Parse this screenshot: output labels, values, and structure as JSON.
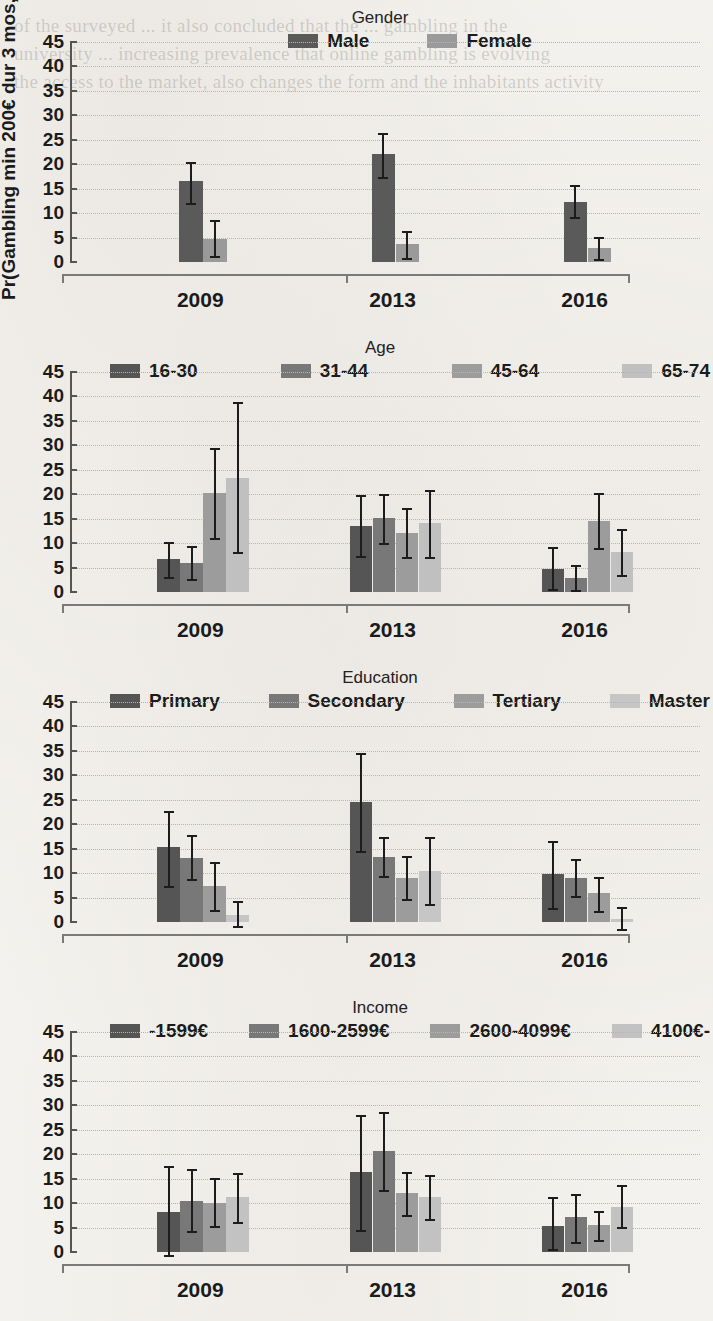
{
  "figure": {
    "ylabel": "Pr(Gambling min 200€ dur 3 mos, %)",
    "ghost_text": "of the surveyed ... it also concluded that the ... gambling in the\nuniversity ... increasing prevalence that online gambling is evolving\nthe access to the market, also changes the form and the inhabitants activity"
  },
  "chart_data": [
    {
      "type": "bar",
      "title": "Gender",
      "xlabel": "",
      "ylabel": "Pr(Gambling min 200€ dur 3 mos, %)",
      "categories": [
        "2009",
        "2013",
        "2016"
      ],
      "ylim": [
        0,
        45
      ],
      "yticks": [
        0,
        5,
        10,
        15,
        20,
        25,
        30,
        35,
        40,
        45
      ],
      "grid": true,
      "legend_position": "top",
      "series": [
        {
          "name": "Male",
          "color": "#5a5a5a",
          "values": [
            16.5,
            22.1,
            12.2
          ],
          "err_low": [
            12.1,
            17.4,
            9.3
          ],
          "err_high": [
            20.4,
            26.3,
            15.7
          ]
        },
        {
          "name": "Female",
          "color": "#9a9a9a",
          "values": [
            4.7,
            3.7,
            2.9
          ],
          "err_low": [
            1.2,
            0.8,
            0.7
          ],
          "err_high": [
            8.6,
            6.4,
            5.1
          ]
        }
      ]
    },
    {
      "type": "bar",
      "title": "Age",
      "xlabel": "",
      "ylabel": "Pr(Gambling min 200€ dur 3 mos, %)",
      "categories": [
        "2009",
        "2013",
        "2016"
      ],
      "ylim": [
        0,
        45
      ],
      "yticks": [
        0,
        5,
        10,
        15,
        20,
        25,
        30,
        35,
        40,
        45
      ],
      "grid": true,
      "legend_position": "top",
      "series": [
        {
          "name": "16-30",
          "color": "#555555",
          "values": [
            6.8,
            13.5,
            4.7
          ],
          "err_low": [
            3.1,
            7.3,
            0.6
          ],
          "err_high": [
            10.3,
            19.8,
            9.3
          ]
        },
        {
          "name": "31-44",
          "color": "#787878",
          "values": [
            5.9,
            15.2,
            2.9
          ],
          "err_low": [
            2.7,
            10.1,
            0.4
          ],
          "err_high": [
            9.5,
            20.1,
            5.6
          ]
        },
        {
          "name": "45-64",
          "color": "#9c9c9c",
          "values": [
            20.2,
            12.1,
            14.6
          ],
          "err_low": [
            11.1,
            7.2,
            8.9
          ],
          "err_high": [
            29.4,
            17.1,
            20.2
          ]
        },
        {
          "name": "65-74",
          "color": "#c0c0c0",
          "values": [
            23.3,
            14.2,
            8.2
          ],
          "err_low": [
            8.1,
            7.2,
            3.4
          ],
          "err_high": [
            38.8,
            20.8,
            12.8
          ]
        }
      ]
    },
    {
      "type": "bar",
      "title": "Education",
      "xlabel": "",
      "ylabel": "Pr(Gambling min 200€ dur 3 mos, %)",
      "categories": [
        "2009",
        "2013",
        "2016"
      ],
      "ylim": [
        0,
        45
      ],
      "yticks": [
        0,
        5,
        10,
        15,
        20,
        25,
        30,
        35,
        40,
        45
      ],
      "grid": true,
      "legend_position": "top",
      "series": [
        {
          "name": "Primary",
          "color": "#555555",
          "values": [
            15.3,
            24.6,
            9.8
          ],
          "err_low": [
            7.4,
            14.6,
            2.9
          ],
          "err_high": [
            22.8,
            34.6,
            16.5
          ]
        },
        {
          "name": "Secondary",
          "color": "#787878",
          "values": [
            13.0,
            13.3,
            9.1
          ],
          "err_low": [
            8.8,
            9.5,
            5.3
          ],
          "err_high": [
            17.7,
            17.3,
            12.8
          ]
        },
        {
          "name": "Tertiary",
          "color": "#9c9c9c",
          "values": [
            7.4,
            9.0,
            5.9
          ],
          "err_low": [
            2.4,
            4.7,
            2.3
          ],
          "err_high": [
            12.2,
            13.4,
            9.3
          ]
        },
        {
          "name": "Master",
          "color": "#c6c6c6",
          "values": [
            1.4,
            10.5,
            0.7
          ],
          "err_low": [
            -0.9,
            3.7,
            -1.4
          ],
          "err_high": [
            4.3,
            17.4,
            3.1
          ]
        }
      ]
    },
    {
      "type": "bar",
      "title": "Income",
      "xlabel": "",
      "ylabel": "Pr(Gambling min 200€ dur 3 mos, %)",
      "categories": [
        "2009",
        "2013",
        "2016"
      ],
      "ylim": [
        0,
        45
      ],
      "yticks": [
        0,
        5,
        10,
        15,
        20,
        25,
        30,
        35,
        40,
        45
      ],
      "grid": true,
      "legend_position": "top",
      "series": [
        {
          "name": "-1599€",
          "color": "#555555",
          "values": [
            8.1,
            16.4,
            5.4
          ],
          "err_low": [
            -0.6,
            4.6,
            0.6
          ],
          "err_high": [
            17.6,
            28.0,
            11.2
          ]
        },
        {
          "name": "1600-2599€",
          "color": "#787878",
          "values": [
            10.4,
            20.6,
            7.1
          ],
          "err_low": [
            4.2,
            12.6,
            2.1
          ],
          "err_high": [
            16.9,
            28.6,
            11.9
          ]
        },
        {
          "name": "2600-4099€",
          "color": "#9c9c9c",
          "values": [
            10.1,
            12.1,
            5.6
          ],
          "err_low": [
            5.3,
            7.6,
            2.4
          ],
          "err_high": [
            15.2,
            16.3,
            8.3
          ]
        },
        {
          "name": "4100€-",
          "color": "#c2c2c2",
          "values": [
            11.2,
            11.2,
            9.3
          ],
          "err_low": [
            6.2,
            6.8,
            5.1
          ],
          "err_high": [
            16.2,
            15.7,
            13.8
          ]
        }
      ]
    }
  ]
}
